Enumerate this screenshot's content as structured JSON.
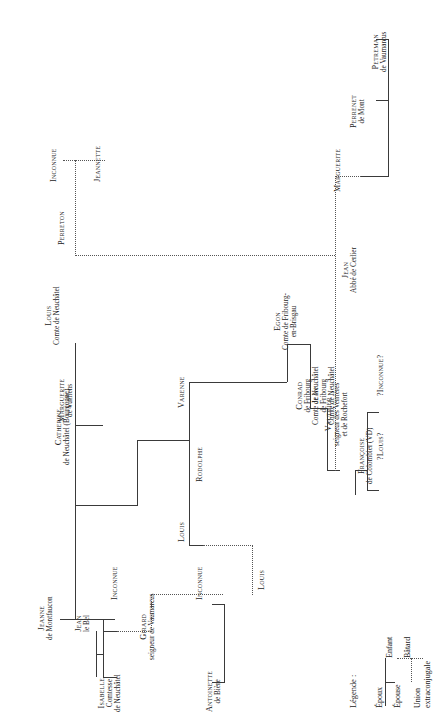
{
  "diagram": {
    "type": "genealogical-tree",
    "orientation": "rotated-90-ccw",
    "title": "",
    "colors": {
      "line": "#3a3a3a",
      "dotted": "#555555",
      "text": "#1a1a1a",
      "background": "#ffffff"
    }
  },
  "people": [
    {
      "id": "jeanne",
      "name": "Jeanne",
      "line2": "de Montfaucon",
      "line3": ""
    },
    {
      "id": "jean_le_bel",
      "name": "Jean",
      "line2": "le Bel",
      "line3": ""
    },
    {
      "id": "isabelle",
      "name": "Isabelle",
      "line2": "Comtesse",
      "line3": "de Neuchâtel"
    },
    {
      "id": "inconnue1",
      "name": "Inconnue",
      "line2": "",
      "line3": ""
    },
    {
      "id": "catherine",
      "name": "Catherine",
      "line2": "de Neuchâtel (Bourgogne)",
      "line3": ""
    },
    {
      "id": "marguerite_vufflens",
      "name": "Marguerite",
      "line2": "de Vufflens",
      "line3": ""
    },
    {
      "id": "louis_comte",
      "name": "Louis",
      "line2": "Comte de Neuchâtel",
      "line3": ""
    },
    {
      "id": "perreton",
      "name": "Perreton",
      "line2": "",
      "line3": ""
    },
    {
      "id": "inconnue2",
      "name": "Inconnue",
      "line2": "",
      "line3": ""
    },
    {
      "id": "jeannette",
      "name": "Jeannette",
      "line2": "",
      "line3": ""
    },
    {
      "id": "louis2",
      "name": "Louis",
      "line2": "",
      "line3": ""
    },
    {
      "id": "inconnue3",
      "name": "Inconnue",
      "line2": "",
      "line3": ""
    },
    {
      "id": "rodolphe",
      "name": "Rodolphe",
      "line2": "",
      "line3": ""
    },
    {
      "id": "varenne",
      "name": "Varenne",
      "line2": "",
      "line3": ""
    },
    {
      "id": "louis3",
      "name": "Louis",
      "line2": "",
      "line3": ""
    },
    {
      "id": "girard",
      "name": "Girard",
      "line2": "seigneur de Vaumarcus",
      "line3": ""
    },
    {
      "id": "antoinette",
      "name": "Antoinette",
      "line2": "de Bière",
      "line3": ""
    },
    {
      "id": "egon",
      "name": "Egon",
      "line2": "Comte de Fribourg-",
      "line3": "en-Brisgau"
    },
    {
      "id": "conrad",
      "name": "Conrad",
      "line2": "de Fribourg",
      "line3": "Comte de Neuchâtel"
    },
    {
      "id": "jean_frib",
      "name": "Jean",
      "line2": "de Fribourg",
      "line3": "Comte de Neuchâtel"
    },
    {
      "id": "vauthier",
      "name": "Vauthier",
      "line2": "seigneur des Verrières",
      "line3": "et de Rochefort"
    },
    {
      "id": "francoise",
      "name": "Françoise",
      "line2": "de Colombier (VD)",
      "line3": ""
    },
    {
      "id": "louis_q",
      "name": "?Louis?",
      "line2": "",
      "line3": ""
    },
    {
      "id": "inconnue_q",
      "name": "?Inconnue?",
      "line2": "",
      "line3": ""
    },
    {
      "id": "jean_cerlier",
      "name": "Jean",
      "line2": "Abbé de Cerlier",
      "line3": ""
    },
    {
      "id": "marguerite",
      "name": "Marguerite",
      "line2": "",
      "line3": ""
    },
    {
      "id": "perrenet",
      "name": "Perrenet",
      "line2": "de Mont",
      "line3": ""
    },
    {
      "id": "petreman",
      "name": "Petreman",
      "line2": "de Vaumarcus",
      "line3": ""
    }
  ],
  "legend": {
    "title": "Légende :",
    "epoux": "Époux",
    "epouse": "Épouse",
    "union": "Union",
    "union2": "extraconjugale",
    "enfant": "Enfant",
    "batard": "Bâtard"
  }
}
